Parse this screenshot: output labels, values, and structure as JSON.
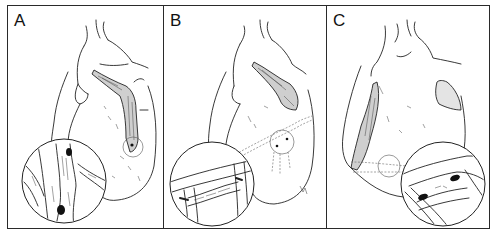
{
  "figure": {
    "border_color": "#2a2a2a",
    "background": "#ffffff",
    "panels": [
      {
        "label": "A",
        "content": "Heart anterior view with vessel graft on left ventricle; magnified circular inset at lower left showing end-to-side anastomosis with two dark sutures"
      },
      {
        "label": "B",
        "content": "Heart anterior view with graft from aorta; dashed sequential graft path across ventricle; magnified inset lower left showing side-to-side anastomosis"
      },
      {
        "label": "C",
        "content": "Heart lateral view with graft along left side; small circle marking anastomosis site; magnified inset lower right showing two dark suture points"
      }
    ]
  }
}
